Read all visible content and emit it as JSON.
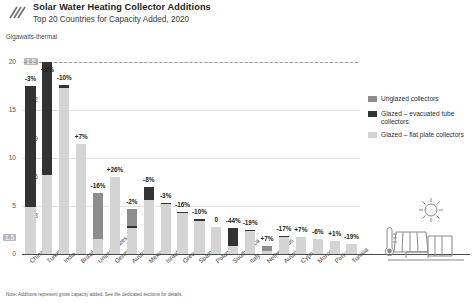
{
  "header": {
    "title": "Solar Water Heating Collector Additions",
    "subtitle": "Top 20 Countries for Capacity Added, 2020",
    "logo_icon": "diagonal-rays-logo"
  },
  "units_label": "Gigawatts-thermal",
  "note": "Note: Additions represent gross capacity added. See the dedicated sections for details.",
  "legend": {
    "position": "right",
    "items": [
      {
        "label": "Unglazed collectors",
        "key": "unglazed",
        "color": "#8d8d8d"
      },
      {
        "label": "Glazed – evacuated tube collectors",
        "key": "evac",
        "color": "#333333"
      },
      {
        "label": "Glazed – flat plate collectors",
        "key": "flat",
        "color": "#d4d4d4"
      }
    ]
  },
  "art": {
    "sun_icon": "sun-icon",
    "panel_icon": "solar-collector-icon",
    "thermometer_icon": "thermometer-icon"
  },
  "chart_data": {
    "type": "bar",
    "title": "Solar Water Heating Collector Additions",
    "subtitle": "Top 20 Countries for Capacity Added, 2020",
    "ylabel": "Gigawatts-thermal",
    "xlabel": "",
    "stacked": true,
    "grid": true,
    "series_names": [
      "Glazed – flat plate collectors",
      "Glazed – evacuated tube collectors",
      "Unglazed collectors"
    ],
    "primary_axis": {
      "ticks": [
        "0",
        "5",
        "10",
        "15",
        "20"
      ],
      "ylim": [
        0,
        20
      ],
      "applies_to": [
        "China"
      ]
    },
    "secondary_axis": {
      "ticks": [
        "0.3",
        "0.6",
        "0.9",
        "1.2",
        "1.5"
      ],
      "ylim": [
        0,
        1.5
      ],
      "highlight_tick": "1.5",
      "applies_to": "all countries except China"
    },
    "zero_marker_label": "1.5",
    "categories": [
      "China",
      "Turkey",
      "India",
      "Brazil",
      "United States",
      "Germany",
      "Australia",
      "Mexico",
      "Israel",
      "Greece",
      "Spain",
      "Poland",
      "South Africa",
      "Italy",
      "Netherlands",
      "Austria",
      "Cyprus",
      "Morocco",
      "Portugal",
      "Tunisia"
    ],
    "change_labels": [
      "-3%",
      "+2%",
      "-10%",
      "+7%",
      "-16%",
      "+26%",
      "-2%",
      "-8%",
      "-3%",
      "-16%",
      "-10%",
      "0",
      "-44%",
      "-19%",
      "+7%",
      "-17%",
      "+7%",
      "-6%",
      "+1%",
      "-19%"
    ],
    "series": [
      {
        "name": "Glazed – flat plate collectors",
        "key": "flat",
        "values": [
          4.9,
          0.62,
          1.3,
          0.86,
          0.12,
          0.6,
          0.2,
          0.42,
          0.39,
          0.32,
          0.26,
          0.21,
          0.06,
          0.18,
          0.02,
          0.13,
          0.13,
          0.12,
          0.1,
          0.08
        ]
      },
      {
        "name": "Glazed – evacuated tube collectors",
        "key": "evac",
        "values": [
          12.6,
          0.88,
          0.02,
          0.0,
          0.0,
          0.0,
          0.02,
          0.1,
          0.01,
          0.01,
          0.01,
          0.0,
          0.14,
          0.01,
          0.0,
          0.01,
          0.0,
          0.0,
          0.0,
          0.0
        ]
      },
      {
        "name": "Unglazed collectors",
        "key": "unglazed",
        "values": [
          0.0,
          0.0,
          0.0,
          0.0,
          0.36,
          0.0,
          0.13,
          0.0,
          0.0,
          0.0,
          0.0,
          0.0,
          0.0,
          0.0,
          0.04,
          0.0,
          0.0,
          0.0,
          0.0,
          0.0
        ]
      }
    ]
  }
}
